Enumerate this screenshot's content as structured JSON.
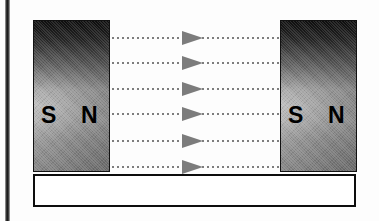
{
  "figure": {
    "background_color": "#fdfdfd"
  },
  "scan_edge": {
    "name": "page-spine-shadow"
  },
  "magnets": [
    {
      "id": "left-magnet",
      "south_label": "S",
      "north_label": "N",
      "x": 33,
      "y": 20,
      "width": 77,
      "height": 152
    },
    {
      "id": "right-magnet",
      "south_label": "S",
      "north_label": "N",
      "x": 280,
      "y": 20,
      "width": 77,
      "height": 152
    }
  ],
  "field_lines": {
    "count": 6,
    "direction": "left-to-right",
    "style": "dotted",
    "color": "#7d7d7d",
    "arrow_color": "#7c7c7c",
    "lines": [
      {
        "y": 37,
        "arrow_x": 70
      },
      {
        "y": 62,
        "arrow_x": 70
      },
      {
        "y": 88,
        "arrow_x": 70
      },
      {
        "y": 113,
        "arrow_x": 70
      },
      {
        "y": 140,
        "arrow_x": 70
      },
      {
        "y": 166,
        "arrow_x": 70
      }
    ]
  },
  "base_bar": {
    "name": "base-plate",
    "fill": "#ffffff",
    "border": "#0d0d0d"
  }
}
